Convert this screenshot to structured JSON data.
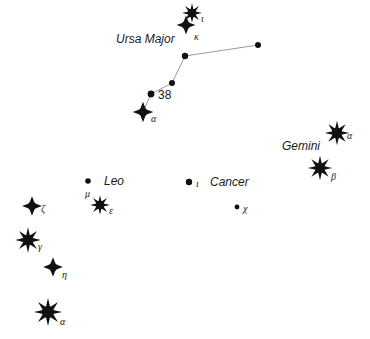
{
  "chart_data": {
    "type": "scatter",
    "title": "",
    "subtitle": "",
    "xlabel": "",
    "ylabel": "",
    "grid": false,
    "legend": "none",
    "background_color": "#ffffff",
    "star_color": "#111111",
    "line_color": "#9a9a9a",
    "xlim": [
      0,
      370
    ],
    "ylim": [
      0,
      339
    ],
    "constellation_labels": [
      {
        "name": "Ursa Major",
        "x": 116,
        "y": 33
      },
      {
        "name": "Gemini",
        "x": 282,
        "y": 140
      },
      {
        "name": "Leo",
        "x": 104,
        "y": 175
      },
      {
        "name": "Cancer",
        "x": 210,
        "y": 176
      }
    ],
    "asterism_lines": [
      {
        "constellation": "Ursa Major",
        "points": [
          [
            143,
            112
          ],
          [
            151,
            94
          ],
          [
            172,
            83
          ],
          [
            185,
            56
          ],
          [
            258,
            45
          ]
        ]
      }
    ],
    "stars": [
      {
        "id": "uma-iota",
        "label": "ι",
        "label_x": 201,
        "label_y": 14,
        "x": 192,
        "y": 13,
        "radius": 4.2,
        "spikes": 8,
        "glyph": "spiked"
      },
      {
        "id": "uma-kappa",
        "label": "κ",
        "label_x": 194,
        "label_y": 32,
        "x": 186,
        "y": 25,
        "radius": 4.0,
        "spikes": 4,
        "glyph": "spiked"
      },
      {
        "id": "uma-node-1",
        "label": "",
        "label_x": 0,
        "label_y": 0,
        "x": 258,
        "y": 45,
        "radius": 3.0,
        "spikes": 0,
        "glyph": "dot"
      },
      {
        "id": "uma-node-2",
        "label": "",
        "label_x": 0,
        "label_y": 0,
        "x": 185,
        "y": 56,
        "radius": 3.2,
        "spikes": 0,
        "glyph": "dot"
      },
      {
        "id": "uma-node-3",
        "label": "",
        "label_x": 0,
        "label_y": 0,
        "x": 172,
        "y": 83,
        "radius": 3.0,
        "spikes": 0,
        "glyph": "dot"
      },
      {
        "id": "uma-38",
        "label": "38",
        "label_x": 158,
        "label_y": 89,
        "x": 151,
        "y": 94,
        "radius": 3.4,
        "spikes": 0,
        "glyph": "dot"
      },
      {
        "id": "uma-alpha",
        "label": "α",
        "label_x": 151,
        "label_y": 114,
        "x": 143,
        "y": 112,
        "radius": 4.4,
        "spikes": 4,
        "glyph": "spiked"
      },
      {
        "id": "gem-alpha",
        "label": "α",
        "label_x": 347,
        "label_y": 131,
        "x": 337,
        "y": 133,
        "radius": 5.2,
        "spikes": 8,
        "glyph": "spiked"
      },
      {
        "id": "gem-beta",
        "label": "β",
        "label_x": 331,
        "label_y": 172,
        "x": 320,
        "y": 168,
        "radius": 5.2,
        "spikes": 8,
        "glyph": "spiked"
      },
      {
        "id": "leo-mu",
        "label": "μ",
        "label_x": 85,
        "label_y": 189,
        "x": 88,
        "y": 181,
        "radius": 2.8,
        "spikes": 0,
        "glyph": "dot"
      },
      {
        "id": "leo-epsilon",
        "label": "ε",
        "label_x": 109,
        "label_y": 206,
        "x": 100,
        "y": 205,
        "radius": 4.2,
        "spikes": 8,
        "glyph": "spiked"
      },
      {
        "id": "cnc-iota",
        "label": "ι",
        "label_x": 196,
        "label_y": 179,
        "x": 189,
        "y": 182,
        "radius": 3.2,
        "spikes": 0,
        "glyph": "dot"
      },
      {
        "id": "cnc-chi",
        "label": "χ",
        "label_x": 243,
        "label_y": 204,
        "x": 237,
        "y": 207,
        "radius": 2.4,
        "spikes": 0,
        "glyph": "dot"
      },
      {
        "id": "left-zeta",
        "label": "ζ",
        "label_x": 41,
        "label_y": 204,
        "x": 32,
        "y": 206,
        "radius": 4.2,
        "spikes": 4,
        "glyph": "spiked"
      },
      {
        "id": "left-gamma",
        "label": "γ",
        "label_x": 38,
        "label_y": 242,
        "x": 28,
        "y": 240,
        "radius": 5.4,
        "spikes": 8,
        "glyph": "spiked"
      },
      {
        "id": "left-eta",
        "label": "η",
        "label_x": 62,
        "label_y": 270,
        "x": 53,
        "y": 267,
        "radius": 4.2,
        "spikes": 4,
        "glyph": "spiked"
      },
      {
        "id": "left-alpha",
        "label": "α",
        "label_x": 60,
        "label_y": 317,
        "x": 48,
        "y": 312,
        "radius": 6.0,
        "spikes": 8,
        "glyph": "spiked"
      }
    ]
  }
}
